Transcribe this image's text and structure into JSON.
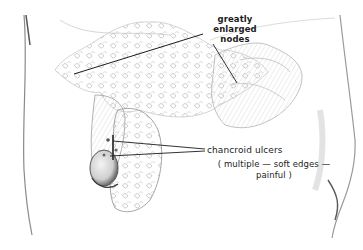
{
  "figure": {
    "background_color": "#ffffff",
    "ink_color": "#1c1c1c"
  },
  "labels": {
    "nodes": {
      "line1": "greatly",
      "line2": "enlarged",
      "line3": "nodes"
    },
    "ulcers": {
      "title": "chancroid ulcers",
      "detail_line1": "( multiple — soft edges —",
      "detail_line2": "painful )"
    }
  }
}
